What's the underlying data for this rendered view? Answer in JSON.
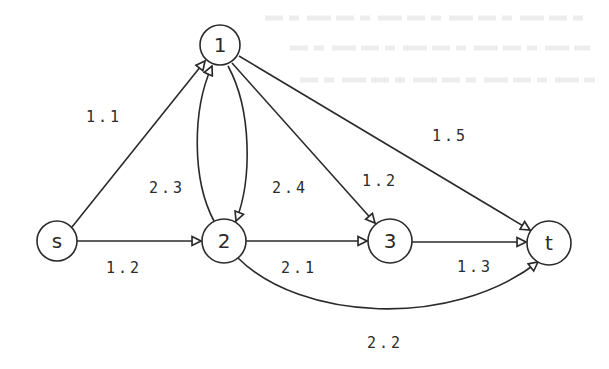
{
  "diagram": {
    "type": "directed-flow-network",
    "colors": {
      "ink": "#2a2a2a",
      "background": "#ffffff"
    },
    "nodes": [
      {
        "id": "s",
        "label": "s",
        "x": 57,
        "y": 241,
        "r": 20
      },
      {
        "id": "1",
        "label": "1",
        "x": 220,
        "y": 47,
        "r": 20
      },
      {
        "id": "2",
        "label": "2",
        "x": 224,
        "y": 241,
        "r": 22
      },
      {
        "id": "3",
        "label": "3",
        "x": 390,
        "y": 241,
        "r": 22
      },
      {
        "id": "t",
        "label": "t",
        "x": 549,
        "y": 243,
        "r": 22
      }
    ],
    "edges": [
      {
        "from": "s",
        "to": "1",
        "label": "1.1"
      },
      {
        "from": "s",
        "to": "2",
        "label": "1.2"
      },
      {
        "from": "2",
        "to": "1",
        "label": "2.3"
      },
      {
        "from": "1",
        "to": "2",
        "label": "2.4"
      },
      {
        "from": "1",
        "to": "3",
        "label": "1.2"
      },
      {
        "from": "1",
        "to": "t",
        "label": "1.5"
      },
      {
        "from": "2",
        "to": "3",
        "label": "2.1"
      },
      {
        "from": "3",
        "to": "t",
        "label": "1.3"
      },
      {
        "from": "2",
        "to": "t",
        "label": "2.2"
      }
    ]
  }
}
